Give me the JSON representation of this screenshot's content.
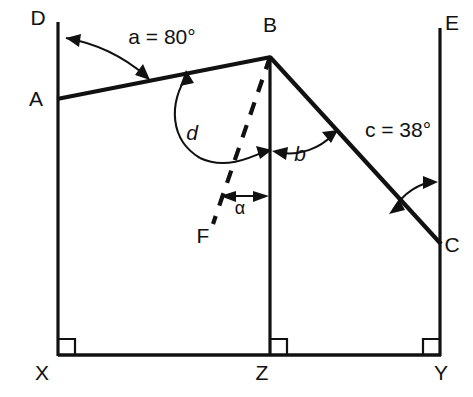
{
  "figure": {
    "background_color": "#ffffff",
    "line_color": "#111111",
    "vertices": [
      {
        "id": "D",
        "label": "D",
        "x": 38,
        "y": 25
      },
      {
        "id": "A",
        "label": "A",
        "x": 36,
        "y": 106
      },
      {
        "id": "B",
        "label": "B",
        "x": 270,
        "y": 32
      },
      {
        "id": "E",
        "label": "E",
        "x": 452,
        "y": 30
      },
      {
        "id": "C",
        "label": "C",
        "x": 452,
        "y": 252
      },
      {
        "id": "F",
        "label": "F",
        "x": 203,
        "y": 243
      },
      {
        "id": "X",
        "label": "X",
        "x": 42,
        "y": 380
      },
      {
        "id": "Z",
        "label": "Z",
        "x": 262,
        "y": 380
      },
      {
        "id": "Y",
        "label": "Y",
        "x": 441,
        "y": 380
      }
    ],
    "angles": [
      {
        "id": "a",
        "symbol": "a",
        "relation": "=",
        "value": "80°",
        "text": "a  =  80°",
        "label_x": 104,
        "label_y": 44
      },
      {
        "id": "d",
        "symbol": "d",
        "relation": "",
        "value": "",
        "text": "d",
        "label_x": 192,
        "label_y": 140
      },
      {
        "id": "b",
        "symbol": "b",
        "relation": "",
        "value": "",
        "text": "b",
        "label_x": 300,
        "label_y": 161
      },
      {
        "id": "c",
        "symbol": "c",
        "relation": "=",
        "value": "38°",
        "text": "c  =  38°",
        "label_x": 345,
        "label_y": 137
      },
      {
        "id": "alpha",
        "symbol": "α",
        "relation": "",
        "value": "",
        "text": "α",
        "label_x": 235,
        "label_y": 212
      }
    ],
    "segments": [
      {
        "id": "DX",
        "from": "D",
        "to": "X",
        "style": "solid",
        "weight": "axis"
      },
      {
        "id": "AB",
        "from": "A",
        "to": "B",
        "style": "solid",
        "weight": "thick"
      },
      {
        "id": "BC",
        "from": "B",
        "to": "C",
        "style": "solid",
        "weight": "thick"
      },
      {
        "id": "BZ",
        "from": "B",
        "to": "Z",
        "style": "solid",
        "weight": "axis"
      },
      {
        "id": "EY",
        "from": "E",
        "to": "Y",
        "style": "solid",
        "weight": "axis"
      },
      {
        "id": "BF",
        "from": "B",
        "to": "F",
        "style": "dashed",
        "weight": "thick"
      },
      {
        "id": "XY",
        "from": "X",
        "to": "Y",
        "style": "solid",
        "weight": "base"
      }
    ],
    "right_angles": [
      {
        "id": "at-X",
        "at": "X"
      },
      {
        "id": "at-Z",
        "at": "Z"
      },
      {
        "id": "at-Y",
        "at": "Y"
      }
    ]
  }
}
